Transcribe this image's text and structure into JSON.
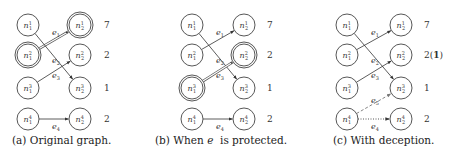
{
  "figure": {
    "panels": [
      {
        "id": "a",
        "caption": "(a) Original graph.",
        "caption_parts": [
          "(a) Original graph."
        ],
        "left_nodes": [
          {
            "label": "n",
            "sup": "1",
            "sub": "1",
            "highlighted": false
          },
          {
            "label": "n",
            "sup": "2",
            "sub": "1",
            "highlighted": true
          },
          {
            "label": "n",
            "sup": "3",
            "sub": "1",
            "highlighted": false
          },
          {
            "label": "n",
            "sup": "4",
            "sub": "1",
            "highlighted": false
          }
        ],
        "right_nodes": [
          {
            "label": "n",
            "sup": "1",
            "sub": "2",
            "highlighted": true
          },
          {
            "label": "n",
            "sup": "2",
            "sub": "2",
            "highlighted": false
          },
          {
            "label": "n",
            "sup": "3",
            "sub": "2",
            "highlighted": false
          },
          {
            "label": "n",
            "sup": "4",
            "sub": "2",
            "highlighted": false
          }
        ],
        "values": [
          "7",
          "2",
          "1",
          "2"
        ],
        "edges": [
          {
            "name": "e1",
            "label": "e",
            "sub": "1",
            "from": 1,
            "to": 0,
            "style": "double"
          },
          {
            "name": "e2",
            "label": "e",
            "sub": "2",
            "from": 0,
            "to": 2,
            "style": "solid"
          },
          {
            "name": "e3",
            "label": "e",
            "sub": "3",
            "from": 2,
            "to": 1,
            "style": "solid"
          },
          {
            "name": "e4",
            "label": "e",
            "sub": "4",
            "from": 3,
            "to": 3,
            "style": "solid"
          }
        ]
      },
      {
        "id": "b",
        "caption_prefix": "(b) When ",
        "caption_em": "e",
        "caption_suffix": "  is protected.",
        "left_nodes": [
          {
            "label": "n",
            "sup": "1",
            "sub": "1",
            "highlighted": false
          },
          {
            "label": "n",
            "sup": "2",
            "sub": "1",
            "highlighted": false
          },
          {
            "label": "n",
            "sup": "3",
            "sub": "1",
            "highlighted": true
          },
          {
            "label": "n",
            "sup": "4",
            "sub": "1",
            "highlighted": false
          }
        ],
        "right_nodes": [
          {
            "label": "n",
            "sup": "1",
            "sub": "2",
            "highlighted": false
          },
          {
            "label": "n",
            "sup": "2",
            "sub": "2",
            "highlighted": true
          },
          {
            "label": "n",
            "sup": "3",
            "sub": "2",
            "highlighted": false
          },
          {
            "label": "n",
            "sup": "4",
            "sub": "2",
            "highlighted": false
          }
        ],
        "values": [
          "7",
          "2",
          "1",
          "2"
        ],
        "edges": [
          {
            "name": "e1",
            "label": "e",
            "sub": "1",
            "from": 1,
            "to": 0,
            "style": "solid"
          },
          {
            "name": "e2",
            "label": "e",
            "sub": "2",
            "from": 0,
            "to": 2,
            "style": "solid"
          },
          {
            "name": "e3",
            "label": "e",
            "sub": "3",
            "from": 2,
            "to": 1,
            "style": "double"
          },
          {
            "name": "e4",
            "label": "e",
            "sub": "4",
            "from": 3,
            "to": 3,
            "style": "solid"
          }
        ]
      },
      {
        "id": "c",
        "caption": "(c) With deception.",
        "left_nodes": [
          {
            "label": "n",
            "sup": "1",
            "sub": "1",
            "highlighted": false
          },
          {
            "label": "n",
            "sup": "2",
            "sub": "1",
            "highlighted": false
          },
          {
            "label": "n",
            "sup": "3",
            "sub": "1",
            "highlighted": false
          },
          {
            "label": "n",
            "sup": "4",
            "sub": "1",
            "highlighted": false
          }
        ],
        "right_nodes": [
          {
            "label": "n",
            "sup": "1",
            "sub": "2",
            "highlighted": false
          },
          {
            "label": "n",
            "sup": "2",
            "sub": "2",
            "highlighted": false
          },
          {
            "label": "n",
            "sup": "3",
            "sub": "2",
            "highlighted": false
          },
          {
            "label": "n",
            "sup": "4",
            "sub": "2",
            "highlighted": false
          }
        ],
        "values": [
          "7",
          "2(1)",
          "1",
          "2"
        ],
        "value_c_row2_main": "2(",
        "value_c_row2_bold": "1",
        "value_c_row2_close": ")",
        "edges": [
          {
            "name": "e1",
            "label": "e",
            "sub": "1",
            "from": 1,
            "to": 0,
            "style": "solid"
          },
          {
            "name": "e2",
            "label": "e",
            "sub": "2",
            "from": 0,
            "to": 2,
            "style": "solid"
          },
          {
            "name": "e3",
            "label": "e",
            "sub": "3",
            "from": 2,
            "to": 1,
            "style": "solid"
          },
          {
            "name": "e4",
            "label": "e",
            "sub": "4",
            "from": 3,
            "to": 3,
            "style": "dotted"
          },
          {
            "name": "e5",
            "label": "e",
            "sub": "5",
            "from": 3,
            "to": 2,
            "style": "dashed"
          }
        ]
      }
    ],
    "colors": {
      "node_stroke": "#444444",
      "edge": "#333333",
      "dashed_edge": "#777777",
      "background": "#ffffff"
    }
  }
}
